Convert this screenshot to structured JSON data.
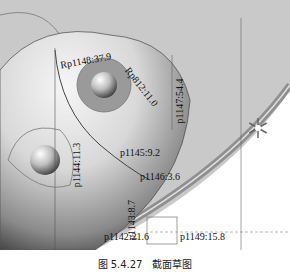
{
  "figure": {
    "caption": "图 5.4.27　截面草图"
  },
  "dimensions": {
    "d1": "Rp1148:37.9",
    "d2": "Rp812:11.0",
    "d3": "p1147:54.4",
    "d4": "p1144:11.3",
    "d5": "p1145:9.2",
    "d6": "p1146:3.6",
    "d7": "p1143:8.7",
    "d8": "p1142:21.6",
    "d9": "p1149:15.8"
  },
  "colors": {
    "background": "#c9c9c9",
    "sphere_light": "#f4f4f4",
    "sphere_dark": "#3a3a3a",
    "ring": "#9a9a9a",
    "line": "#333333"
  }
}
